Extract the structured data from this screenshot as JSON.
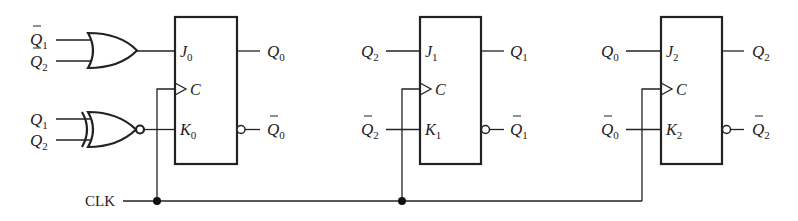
{
  "diagram": {
    "type": "synchronous counter logic diagram",
    "clock_label": "CLK",
    "gates": [
      {
        "type": "OR",
        "inputs": [
          {
            "name": "Q",
            "sub": "1",
            "bar": true
          },
          {
            "name": "Q",
            "sub": "2",
            "bar": true
          }
        ],
        "output_to": "J0"
      },
      {
        "type": "XNOR",
        "inputs": [
          {
            "name": "Q",
            "sub": "1",
            "bar": false
          },
          {
            "name": "Q",
            "sub": "2",
            "bar": false
          }
        ],
        "output_to": "K0"
      }
    ],
    "flip_flops": [
      {
        "id": "FF0",
        "pins": {
          "j": "J",
          "j_sub": "0",
          "c": "C",
          "k": "K",
          "k_sub": "0"
        },
        "outputs": {
          "q": "Q",
          "q_sub": "0",
          "qbar": "Q",
          "qbar_sub": "0"
        }
      },
      {
        "id": "FF1",
        "inputs": {
          "j": {
            "name": "Q",
            "sub": "2",
            "bar": false
          },
          "k": {
            "name": "Q",
            "sub": "2",
            "bar": true
          }
        },
        "pins": {
          "j": "J",
          "j_sub": "1",
          "c": "C",
          "k": "K",
          "k_sub": "1"
        },
        "outputs": {
          "q": "Q",
          "q_sub": "1",
          "qbar": "Q",
          "qbar_sub": "1"
        }
      },
      {
        "id": "FF2",
        "inputs": {
          "j": {
            "name": "Q",
            "sub": "0",
            "bar": false
          },
          "k": {
            "name": "Q",
            "sub": "0",
            "bar": true
          }
        },
        "pins": {
          "j": "J",
          "j_sub": "2",
          "c": "C",
          "k": "K",
          "k_sub": "2"
        },
        "outputs": {
          "q": "Q",
          "q_sub": "2",
          "qbar": "Q",
          "qbar_sub": "2"
        }
      }
    ]
  },
  "labels": {
    "or_in1": "Q",
    "or_in1_sub": "1",
    "or_in2": "Q",
    "or_in2_sub": "2",
    "xnor_in1": "Q",
    "xnor_in1_sub": "1",
    "xnor_in2": "Q",
    "xnor_in2_sub": "2",
    "ff1_j_in": "Q",
    "ff1_j_in_sub": "2",
    "ff1_k_in": "Q",
    "ff1_k_in_sub": "2",
    "ff2_j_in": "Q",
    "ff2_j_in_sub": "0",
    "ff2_k_in": "Q",
    "ff2_k_in_sub": "0",
    "clk": "CLK"
  }
}
